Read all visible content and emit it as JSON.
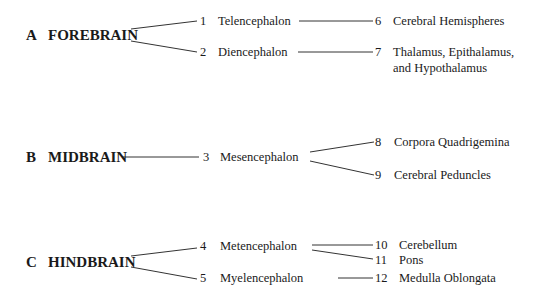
{
  "divisions": [
    {
      "letter": "A",
      "name": "FOREBRAIN"
    },
    {
      "letter": "B",
      "name": "MIDBRAIN"
    },
    {
      "letter": "C",
      "name": "HINDBRAIN"
    }
  ],
  "vesicles": [
    {
      "num": "1",
      "name": "Telencephalon"
    },
    {
      "num": "2",
      "name": "Diencephalon"
    },
    {
      "num": "3",
      "name": "Mesencephalon"
    },
    {
      "num": "4",
      "name": "Metencephalon"
    },
    {
      "num": "5",
      "name": "Myelencephalon"
    }
  ],
  "derivatives": [
    {
      "num": "6",
      "name": "Cerebral Hemispheres"
    },
    {
      "num": "7",
      "name": "Thalamus, Epithalamus,",
      "name2": "and Hypothalamus"
    },
    {
      "num": "8",
      "name": "Corpora Quadrigemina"
    },
    {
      "num": "9",
      "name": "Cerebral Peduncles"
    },
    {
      "num": "10",
      "name": "Cerebellum"
    },
    {
      "num": "11",
      "name": "Pons"
    },
    {
      "num": "12",
      "name": "Medulla Oblongata"
    }
  ]
}
